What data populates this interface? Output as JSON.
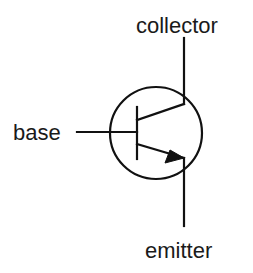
{
  "diagram": {
    "type": "NPN bipolar junction transistor schematic symbol",
    "labels": {
      "collector": "collector",
      "base": "base",
      "emitter": "emitter"
    },
    "colors": {
      "stroke": "#111111",
      "text": "#1a1a1a",
      "background": "#ffffff"
    }
  }
}
